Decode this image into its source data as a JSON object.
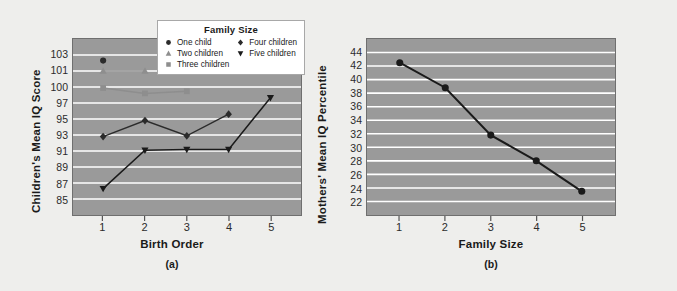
{
  "figure": {
    "background_color": "#eeeeec",
    "plot_background_color": "#9a9a9a",
    "gridline_color": "#ffffff"
  },
  "legend": {
    "title": "Family Size",
    "position": "top-center-overlapping-panel-a",
    "columns": [
      [
        {
          "label": "One child",
          "marker": "circle",
          "color": "#2b2b2b"
        },
        {
          "label": "Two children",
          "marker": "triangle-up",
          "color": "#8e8e8e"
        },
        {
          "label": "Three children",
          "marker": "square",
          "color": "#8e8e8e"
        }
      ],
      [
        {
          "label": "Four children",
          "marker": "diamond",
          "color": "#2b2b2b"
        },
        {
          "label": "Five children",
          "marker": "triangle-down",
          "color": "#1a1a1a"
        }
      ]
    ]
  },
  "chart_data": [
    {
      "type": "line",
      "panel": "(a)",
      "title": "",
      "xlabel": "Birth Order",
      "ylabel": "Children's Mean IQ Score",
      "x": [
        1,
        2,
        3,
        4,
        5
      ],
      "xticklabels": [
        "1",
        "2",
        "3",
        "4",
        "5"
      ],
      "yticklabels": [
        "103",
        "101",
        "100",
        "97",
        "95",
        "93",
        "91",
        "89",
        "87",
        "85"
      ],
      "ylim": [
        84,
        104
      ],
      "grid": true,
      "legend": "Family Size",
      "series": [
        {
          "name": "One child",
          "marker": "circle",
          "color": "#2b2b2b",
          "x": [
            1
          ],
          "values": [
            102.3
          ]
        },
        {
          "name": "Two children",
          "marker": "triangle-up",
          "color": "#8e8e8e",
          "x": [
            1,
            2
          ],
          "values": [
            101.0,
            101.0
          ]
        },
        {
          "name": "Three children",
          "marker": "square",
          "color": "#8e8e8e",
          "x": [
            1,
            2,
            3
          ],
          "values": [
            99.8,
            98.8,
            99.2
          ]
        },
        {
          "name": "Four children",
          "marker": "diamond",
          "color": "#2b2b2b",
          "x": [
            1,
            2,
            3,
            4
          ],
          "values": [
            92.8,
            94.8,
            92.9,
            95.6
          ]
        },
        {
          "name": "Five children",
          "marker": "triangle-down",
          "color": "#1a1a1a",
          "x": [
            1,
            2,
            3,
            4,
            5
          ],
          "values": [
            86.3,
            91.1,
            91.2,
            91.2,
            98.0
          ]
        }
      ]
    },
    {
      "type": "line",
      "panel": "(b)",
      "title": "",
      "xlabel": "Family Size",
      "ylabel": "Mothers' Mean IQ Percentile",
      "x": [
        1,
        2,
        3,
        4,
        5
      ],
      "xticklabels": [
        "1",
        "2",
        "3",
        "4",
        "5"
      ],
      "yticklabels": [
        "44",
        "42",
        "40",
        "38",
        "36",
        "34",
        "32",
        "30",
        "28",
        "26",
        "24",
        "22"
      ],
      "ylim": [
        21,
        45
      ],
      "grid": true,
      "series": [
        {
          "name": "Mothers' Mean IQ Percentile",
          "marker": "circle",
          "color": "#1a1a1a",
          "x": [
            1,
            2,
            3,
            4,
            5
          ],
          "values": [
            42.5,
            38.8,
            31.8,
            28.0,
            23.5
          ]
        }
      ]
    }
  ]
}
